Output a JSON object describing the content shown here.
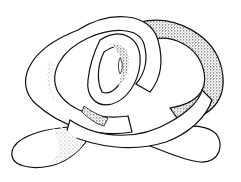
{
  "image": {
    "subject": "pretzel-shaped knotted tube illustration",
    "style": "black ink line drawing with stipple shading",
    "colors": {
      "background": "#ffffff",
      "ink": "#111111",
      "tube_fill": "#ffffff"
    }
  }
}
